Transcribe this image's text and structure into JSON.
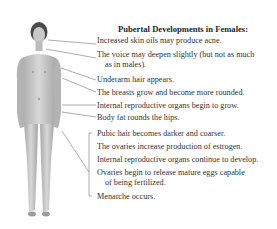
{
  "diagram": {
    "title": "Pubertal Developments in Females:",
    "figure_label": "female-figure",
    "colors": {
      "text": "#333333",
      "leader": "#8a8a8a",
      "skin": "#bdbdbd"
    },
    "items": [
      {
        "text": "Increased skin oils may produce acne."
      },
      {
        "text": "The voice may deepen slightly (but not as much",
        "cont": "as in males)."
      },
      {
        "text": "Underarm hair appears."
      },
      {
        "text": "The breasts grow and become more rounded."
      },
      {
        "text": "Internal reproductive organs begin to grow."
      },
      {
        "text": "Body fat rounds the hips."
      },
      {
        "text": "Pubic hair becomes darker and coarser."
      },
      {
        "text": "The ovaries increase production of estrogen."
      },
      {
        "text": "Internal reproductive organs continue to develop."
      },
      {
        "text": "Ovaries begin to release mature eggs capable",
        "cont": "of being fertilized."
      },
      {
        "text": "Menarche occurs."
      }
    ]
  }
}
